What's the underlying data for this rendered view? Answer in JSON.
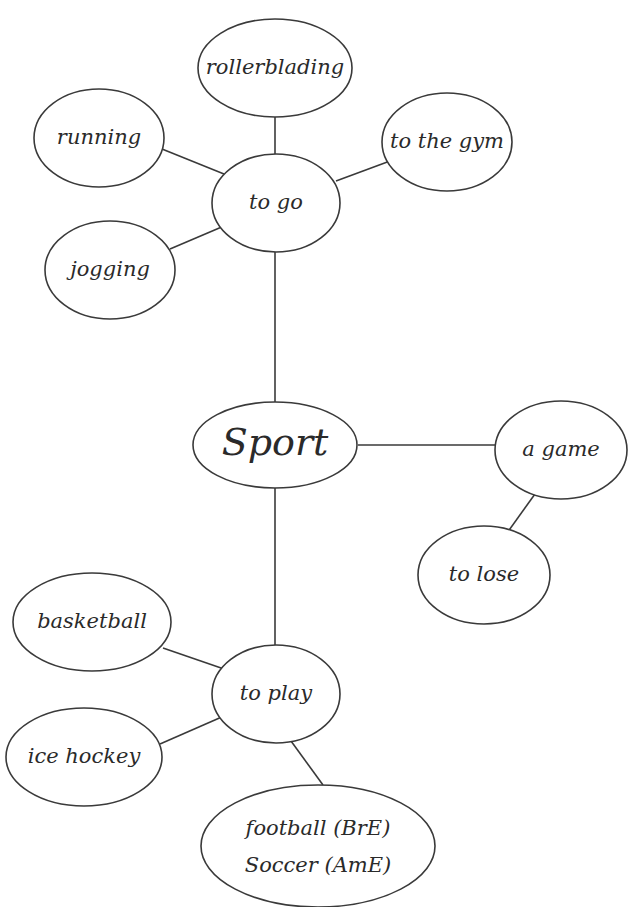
{
  "diagram": {
    "title": "Sport",
    "nodes": [
      {
        "id": "sport",
        "label": "Sport",
        "cx": 275,
        "cy": 445,
        "rx": 82,
        "ry": 43
      },
      {
        "id": "to_go",
        "label": "to go",
        "cx": 276,
        "cy": 203,
        "rx": 64,
        "ry": 49
      },
      {
        "id": "rollerblading",
        "label": "rollerblading",
        "cx": 275,
        "cy": 68,
        "rx": 77,
        "ry": 49
      },
      {
        "id": "running",
        "label": "running",
        "cx": 99,
        "cy": 138,
        "rx": 65,
        "ry": 49
      },
      {
        "id": "to_the_gym",
        "label": "to the gym",
        "cx": 447,
        "cy": 142,
        "rx": 65,
        "ry": 49
      },
      {
        "id": "jogging",
        "label": "jogging",
        "cx": 110,
        "cy": 270,
        "rx": 65,
        "ry": 49
      },
      {
        "id": "a_game",
        "label": "a game",
        "cx": 561,
        "cy": 450,
        "rx": 66,
        "ry": 49
      },
      {
        "id": "to_lose",
        "label": "to lose",
        "cx": 484,
        "cy": 575,
        "rx": 66,
        "ry": 49
      },
      {
        "id": "to_play",
        "label": "to play",
        "cx": 276,
        "cy": 694,
        "rx": 64,
        "ry": 49
      },
      {
        "id": "basketball",
        "label": "basketball",
        "cx": 92,
        "cy": 622,
        "rx": 79,
        "ry": 49
      },
      {
        "id": "ice_hockey",
        "label": "ice hockey",
        "cx": 84,
        "cy": 757,
        "rx": 78,
        "ry": 49
      },
      {
        "id": "football",
        "label": "football (BrE)",
        "label2": "Soccer (AmE)",
        "cx": 318,
        "cy": 846,
        "rx": 117,
        "ry": 61
      }
    ],
    "edges": [
      {
        "x1": 275,
        "y1": 154,
        "x2": 275,
        "y2": 117
      },
      {
        "x1": 224,
        "y1": 174,
        "x2": 162,
        "y2": 149
      },
      {
        "x1": 336,
        "y1": 181,
        "x2": 390,
        "y2": 161
      },
      {
        "x1": 224,
        "y1": 226,
        "x2": 170,
        "y2": 249
      },
      {
        "x1": 275,
        "y1": 252,
        "x2": 275,
        "y2": 402
      },
      {
        "x1": 358,
        "y1": 445,
        "x2": 495,
        "y2": 445
      },
      {
        "x1": 540,
        "y1": 487,
        "x2": 507,
        "y2": 533
      },
      {
        "x1": 275,
        "y1": 488,
        "x2": 275,
        "y2": 645
      },
      {
        "x1": 163,
        "y1": 648,
        "x2": 224,
        "y2": 669
      },
      {
        "x1": 160,
        "y1": 744,
        "x2": 224,
        "y2": 716
      },
      {
        "x1": 291,
        "y1": 741,
        "x2": 323,
        "y2": 785
      }
    ]
  }
}
